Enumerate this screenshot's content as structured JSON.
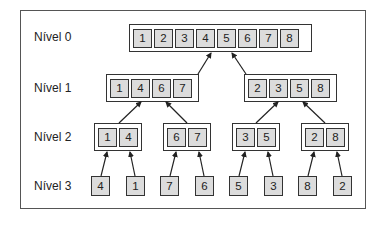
{
  "diagram": {
    "levels": [
      {
        "label": "Nível 0",
        "groups": [
          [
            "1",
            "2",
            "3",
            "4",
            "5",
            "6",
            "7",
            "8"
          ]
        ]
      },
      {
        "label": "Nível 1",
        "groups": [
          [
            "1",
            "4",
            "6",
            "7"
          ],
          [
            "2",
            "3",
            "5",
            "8"
          ]
        ]
      },
      {
        "label": "Nível 2",
        "groups": [
          [
            "1",
            "4"
          ],
          [
            "6",
            "7"
          ],
          [
            "3",
            "5"
          ],
          [
            "2",
            "8"
          ]
        ]
      },
      {
        "label": "Nível 3",
        "leaves": [
          "4",
          "1",
          "7",
          "6",
          "5",
          "3",
          "8",
          "2"
        ]
      }
    ],
    "colors": {
      "cell_fill": "#dcdcdc",
      "border": "#333333",
      "frame": "#555555",
      "text": "#222222"
    }
  }
}
